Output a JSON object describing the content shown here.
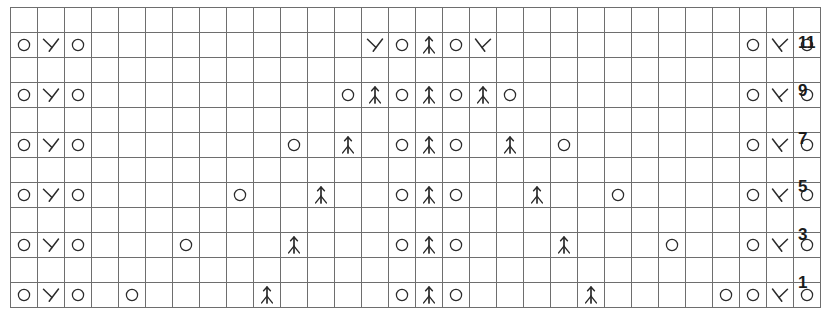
{
  "chart_data": {
    "type": "table",
    "columns": 30,
    "rows": 12,
    "row_labels": [
      "11",
      "",
      "9",
      "",
      "7",
      "",
      "5",
      "",
      "3",
      "",
      "1",
      ""
    ],
    "row_numbers_visible": [
      "11",
      "9",
      "7",
      "5",
      "3",
      "1"
    ],
    "legend": {
      "O": "yarn-over",
      "left-dec": "left-leaning decrease (k2tog)",
      "right-dec": "right-leaning decrease (ssk)",
      "center-dec": "centered double decrease",
      "empty": "knit / blank"
    },
    "symbol_glyphs": {
      "O": "O",
      "left-dec": "lambda",
      "right-dec": "mirrored-lambda",
      "center-dec": "arrow-up-fork",
      "empty": ""
    },
    "grid": [
      [
        "empty",
        "empty",
        "empty",
        "empty",
        "empty",
        "empty",
        "empty",
        "empty",
        "empty",
        "empty",
        "empty",
        "empty",
        "empty",
        "empty",
        "empty",
        "empty",
        "empty",
        "empty",
        "empty",
        "empty",
        "empty",
        "empty",
        "empty",
        "empty",
        "empty",
        "empty",
        "empty",
        "empty",
        "empty",
        "empty"
      ],
      [
        "O",
        "left-dec",
        "O",
        "empty",
        "empty",
        "empty",
        "empty",
        "empty",
        "empty",
        "empty",
        "empty",
        "empty",
        "empty",
        "left-dec",
        "O",
        "center-dec",
        "O",
        "right-dec",
        "empty",
        "empty",
        "empty",
        "empty",
        "empty",
        "empty",
        "empty",
        "empty",
        "empty",
        "O",
        "right-dec",
        "O"
      ],
      [
        "empty",
        "empty",
        "empty",
        "empty",
        "empty",
        "empty",
        "empty",
        "empty",
        "empty",
        "empty",
        "empty",
        "empty",
        "empty",
        "empty",
        "empty",
        "empty",
        "empty",
        "empty",
        "empty",
        "empty",
        "empty",
        "empty",
        "empty",
        "empty",
        "empty",
        "empty",
        "empty",
        "empty",
        "empty",
        "empty"
      ],
      [
        "O",
        "left-dec",
        "O",
        "empty",
        "empty",
        "empty",
        "empty",
        "empty",
        "empty",
        "empty",
        "empty",
        "empty",
        "O",
        "center-dec",
        "O",
        "center-dec",
        "O",
        "center-dec",
        "O",
        "empty",
        "empty",
        "empty",
        "empty",
        "empty",
        "empty",
        "empty",
        "empty",
        "O",
        "right-dec",
        "O"
      ],
      [
        "empty",
        "empty",
        "empty",
        "empty",
        "empty",
        "empty",
        "empty",
        "empty",
        "empty",
        "empty",
        "empty",
        "empty",
        "empty",
        "empty",
        "empty",
        "empty",
        "empty",
        "empty",
        "empty",
        "empty",
        "empty",
        "empty",
        "empty",
        "empty",
        "empty",
        "empty",
        "empty",
        "empty",
        "empty",
        "empty"
      ],
      [
        "O",
        "left-dec",
        "O",
        "empty",
        "empty",
        "empty",
        "empty",
        "empty",
        "empty",
        "empty",
        "O",
        "empty",
        "center-dec",
        "empty",
        "O",
        "center-dec",
        "O",
        "empty",
        "center-dec",
        "empty",
        "O",
        "empty",
        "empty",
        "empty",
        "empty",
        "empty",
        "empty",
        "O",
        "right-dec",
        "O"
      ],
      [
        "empty",
        "empty",
        "empty",
        "empty",
        "empty",
        "empty",
        "empty",
        "empty",
        "empty",
        "empty",
        "empty",
        "empty",
        "empty",
        "empty",
        "empty",
        "empty",
        "empty",
        "empty",
        "empty",
        "empty",
        "empty",
        "empty",
        "empty",
        "empty",
        "empty",
        "empty",
        "empty",
        "empty",
        "empty",
        "empty"
      ],
      [
        "O",
        "left-dec",
        "O",
        "empty",
        "empty",
        "empty",
        "empty",
        "empty",
        "O",
        "empty",
        "empty",
        "center-dec",
        "empty",
        "empty",
        "O",
        "center-dec",
        "O",
        "empty",
        "empty",
        "center-dec",
        "empty",
        "empty",
        "O",
        "empty",
        "empty",
        "empty",
        "empty",
        "O",
        "right-dec",
        "O"
      ],
      [
        "empty",
        "empty",
        "empty",
        "empty",
        "empty",
        "empty",
        "empty",
        "empty",
        "empty",
        "empty",
        "empty",
        "empty",
        "empty",
        "empty",
        "empty",
        "empty",
        "empty",
        "empty",
        "empty",
        "empty",
        "empty",
        "empty",
        "empty",
        "empty",
        "empty",
        "empty",
        "empty",
        "empty",
        "empty",
        "empty"
      ],
      [
        "O",
        "left-dec",
        "O",
        "empty",
        "empty",
        "empty",
        "O",
        "empty",
        "empty",
        "empty",
        "center-dec",
        "empty",
        "empty",
        "empty",
        "O",
        "center-dec",
        "O",
        "empty",
        "empty",
        "empty",
        "center-dec",
        "empty",
        "empty",
        "empty",
        "O",
        "empty",
        "empty",
        "O",
        "right-dec",
        "O"
      ],
      [
        "empty",
        "empty",
        "empty",
        "empty",
        "empty",
        "empty",
        "empty",
        "empty",
        "empty",
        "empty",
        "empty",
        "empty",
        "empty",
        "empty",
        "empty",
        "empty",
        "empty",
        "empty",
        "empty",
        "empty",
        "empty",
        "empty",
        "empty",
        "empty",
        "empty",
        "empty",
        "empty",
        "empty",
        "empty",
        "empty"
      ],
      [
        "O",
        "left-dec",
        "O",
        "empty",
        "O",
        "empty",
        "empty",
        "empty",
        "empty",
        "center-dec",
        "empty",
        "empty",
        "empty",
        "empty",
        "O",
        "center-dec",
        "O",
        "empty",
        "empty",
        "empty",
        "empty",
        "center-dec",
        "empty",
        "empty",
        "empty",
        "empty",
        "O",
        "O",
        "right-dec",
        "O"
      ]
    ],
    "grid_row_labels": [
      "",
      "11",
      "",
      "9",
      "",
      "7",
      "",
      "5",
      "",
      "3",
      "",
      "1"
    ],
    "colors": {
      "grid_line": "#6e6e6e",
      "symbol": "#2b2b2b",
      "row_number": "#1b1b1b",
      "background": "#ffffff"
    }
  },
  "footer": {
    "mark": ""
  }
}
